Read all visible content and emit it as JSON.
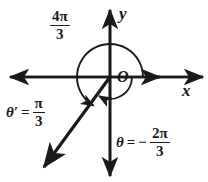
{
  "diagram": {
    "background_color": "#ffffff",
    "ink_color": "#1a1a1a",
    "axes": {
      "x_label": "x",
      "y_label": "y",
      "origin_label": "O",
      "x_axis_y": 77,
      "y_axis_x": 110,
      "x_axis_from": 8,
      "x_axis_to": 205,
      "y_axis_from": 8,
      "y_axis_to": 178,
      "double_arrow_x": 160
    },
    "labels": {
      "top_angle": {
        "numerator_coefficient": "4",
        "numerator_symbol": "π",
        "denominator": "3",
        "text": "4π/3",
        "meaning": "positive coterminal angle measure, counterclockwise"
      },
      "reference_angle": {
        "symbol": "θ′",
        "equals": "=",
        "numerator_symbol": "π",
        "denominator": "3",
        "text": "θ′ = π/3",
        "meaning": "reference angle"
      },
      "main_angle": {
        "symbol": "θ",
        "equals": "=",
        "sign": "−",
        "numerator_coefficient": "2",
        "numerator_symbol": "π",
        "denominator": "3",
        "text": "θ = −2π/3",
        "meaning": "negative angle measure, clockwise"
      }
    },
    "geometry": {
      "terminal_ray": {
        "angle_degrees": 240,
        "from_x": 110,
        "from_y": 77,
        "to_x": 42,
        "to_y": 170,
        "arrowhead": "end"
      },
      "outer_arc": {
        "name": "counterclockwise-arc-4pi-over-3",
        "radius": 33,
        "start_degrees": 0,
        "sweep_degrees": 240,
        "direction": "counterclockwise",
        "arrowhead": "end"
      },
      "inner_arc": {
        "name": "clockwise-arc-negative-2pi-over-3",
        "radius": 22,
        "start_degrees": 0,
        "sweep_degrees": -120,
        "direction": "clockwise",
        "arrowhead": "end"
      }
    }
  }
}
